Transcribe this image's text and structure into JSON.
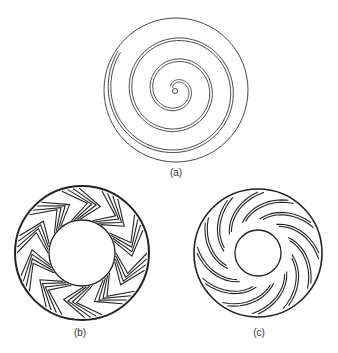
{
  "figures": [
    {
      "label": "(a)",
      "description": "Archimedean spiral double-line disk",
      "cx": 176,
      "cy": 90,
      "r": 72
    },
    {
      "label": "(b)",
      "description": "Annulus with herringbone chevron channels",
      "cx": 82,
      "cy": 253,
      "r_outer": 67,
      "r_inner": 33
    },
    {
      "label": "(c)",
      "description": "Annulus with curved radial slots",
      "cx": 258,
      "cy": 253,
      "r_outer": 64,
      "r_inner": 23
    }
  ],
  "colors": {
    "stroke": "#222222",
    "background": "#ffffff"
  }
}
